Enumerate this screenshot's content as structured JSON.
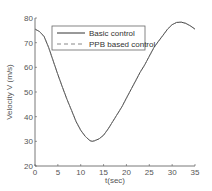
{
  "chart_data": {
    "type": "line",
    "title": "",
    "xlabel": "t(sec)",
    "ylabel": "Velocity V (m/s)",
    "xlim": [
      0,
      35
    ],
    "ylim": [
      20,
      80
    ],
    "xticks": [
      0,
      5,
      10,
      15,
      20,
      25,
      30,
      35
    ],
    "yticks": [
      20,
      30,
      40,
      50,
      60,
      70,
      80
    ],
    "grid": false,
    "legend_position": "upper center",
    "x": [
      0,
      1,
      2,
      3,
      4,
      5,
      6,
      7,
      8,
      9,
      10,
      11,
      12,
      12.5,
      13,
      14,
      15,
      16,
      17,
      18,
      19,
      20,
      21,
      22,
      23,
      24,
      25,
      26,
      27,
      28,
      29,
      30,
      31,
      32,
      33,
      34,
      35
    ],
    "series": [
      {
        "name": "Basic control",
        "style": "solid",
        "color": "#333333",
        "values": [
          75.5,
          74.5,
          72.5,
          68,
          62.5,
          57,
          52,
          47,
          42.5,
          38,
          34.5,
          32,
          30.3,
          30,
          30.2,
          31,
          32.5,
          35,
          38,
          41,
          44,
          47.5,
          51,
          54.5,
          58,
          61,
          64.5,
          68,
          70.5,
          73,
          75.5,
          77.3,
          78.2,
          78.3,
          77.8,
          76.8,
          75.5
        ]
      },
      {
        "name": "PPB based control",
        "style": "dashed",
        "color": "#888888",
        "values": [
          75.5,
          74.5,
          72.5,
          68,
          62.5,
          57,
          52,
          47,
          42.5,
          38,
          34.5,
          32,
          30.3,
          30,
          30.2,
          31,
          32.5,
          35,
          38,
          41,
          44,
          47.5,
          51,
          54.5,
          58,
          61,
          64.5,
          68,
          70.5,
          73,
          75.5,
          77.3,
          78.2,
          78.3,
          77.8,
          76.8,
          75.5
        ]
      }
    ]
  },
  "legend": {
    "items": [
      {
        "label": "Basic control"
      },
      {
        "label": "PPB based control"
      }
    ]
  },
  "axes": {
    "xlabel": "t(sec)",
    "ylabel": "Velocity V (m/s)"
  },
  "colors": {
    "axis": "#555555",
    "line": "#333333",
    "dashed": "#888888"
  }
}
